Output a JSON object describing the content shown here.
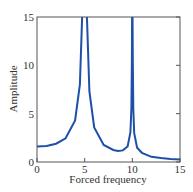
{
  "chart_data": {
    "type": "line",
    "title": "",
    "xlabel": "Forced frequency",
    "ylabel": "Amplitude",
    "xlim": [
      0,
      15
    ],
    "ylim": [
      0,
      15
    ],
    "xticks": [
      0,
      5,
      10,
      15
    ],
    "yticks": [
      0,
      5,
      10,
      15
    ],
    "grid": false,
    "legend": null,
    "series": [
      {
        "name": "Amplitude",
        "color": "#1f4fa8",
        "x": [
          0,
          1,
          2,
          3,
          4,
          4.5,
          4.75,
          4.85,
          5.15,
          5.25,
          5.5,
          6,
          7,
          8,
          8.5,
          9,
          9.5,
          9.8,
          9.9,
          9.95,
          9.98,
          10.02,
          10.05,
          10.1,
          10.2,
          10.5,
          11,
          12,
          13,
          14,
          15
        ],
        "y": [
          1.6,
          1.66,
          1.89,
          2.45,
          4.29,
          8.02,
          15.5,
          15.5,
          15.5,
          14.8,
          7.29,
          3.57,
          1.76,
          1.24,
          1.15,
          1.2,
          1.6,
          3.05,
          5.57,
          10.56,
          15.5,
          15.5,
          10.5,
          5.5,
          2.99,
          1.47,
          0.95,
          0.54,
          0.41,
          0.32,
          0.27
        ]
      }
    ]
  }
}
